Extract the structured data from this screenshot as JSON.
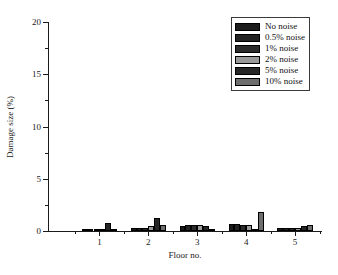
{
  "chart_data": {
    "type": "bar",
    "title": "",
    "xlabel": "Floor no.",
    "ylabel": "Damage size (%)",
    "categories": [
      "1",
      "2",
      "3",
      "4",
      "5"
    ],
    "xtick_labels": [
      "1",
      "2",
      "3",
      "4",
      "5"
    ],
    "ytick_labels": [
      "0",
      "5",
      "10",
      "15",
      "20"
    ],
    "ytick_values": [
      0,
      5,
      10,
      15,
      20
    ],
    "yminor_values": [
      2.5,
      7.5,
      12.5,
      17.5
    ],
    "ylim": [
      0,
      20
    ],
    "grid": false,
    "legend_position": "top-right",
    "series": [
      {
        "name": "No noise",
        "color": "#1c1c1c",
        "values": [
          0.08,
          0.25,
          0.52,
          0.65,
          0.3
        ]
      },
      {
        "name": "0.5% noise",
        "color": "#232323",
        "values": [
          0.06,
          0.3,
          0.55,
          0.68,
          0.32
        ]
      },
      {
        "name": "1% noise",
        "color": "#2b2b2b",
        "values": [
          0.05,
          0.28,
          0.6,
          0.62,
          0.28
        ]
      },
      {
        "name": "2% noise",
        "color": "#9a9a9a",
        "values": [
          0.22,
          0.45,
          0.62,
          0.6,
          0.25
        ]
      },
      {
        "name": "5% noise",
        "color": "#262626",
        "values": [
          0.75,
          1.2,
          0.45,
          0.2,
          0.5
        ]
      },
      {
        "name": "10% noise",
        "color": "#6e6e6e",
        "values": [
          0.1,
          0.6,
          0.12,
          1.8,
          0.6
        ]
      }
    ]
  },
  "legend": {
    "entries": [
      {
        "label": "No noise"
      },
      {
        "label": "0.5% noise"
      },
      {
        "label": "1% noise"
      },
      {
        "label": "2% noise"
      },
      {
        "label": "5% noise"
      },
      {
        "label": "10% noise"
      }
    ]
  }
}
